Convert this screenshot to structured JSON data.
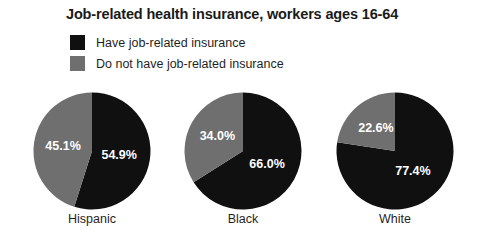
{
  "chart_data": {
    "type": "pie",
    "title": "Job-related health insurance, workers ages 16-64",
    "xlabel": "",
    "ylabel": "",
    "legend_position": "top-left",
    "grid": false,
    "categories": [
      "Hispanic",
      "Black",
      "White"
    ],
    "series": [
      {
        "name": "Have job-related insurance",
        "color": "#101010",
        "values": [
          54.9,
          66.0,
          77.4
        ]
      },
      {
        "name": "Do not have job-related insurance",
        "color": "#6f6f6f",
        "values": [
          45.1,
          34.0,
          22.6
        ]
      }
    ],
    "pies": [
      {
        "group": "Hispanic",
        "caption": "Hispanic",
        "slices": [
          {
            "label": "54.9%",
            "value": 54.9,
            "series": "Have job-related insurance",
            "color": "#101010"
          },
          {
            "label": "45.1%",
            "value": 45.1,
            "series": "Do not have job-related insurance",
            "color": "#6f6f6f"
          }
        ]
      },
      {
        "group": "Black",
        "caption": "Black",
        "slices": [
          {
            "label": "66.0%",
            "value": 66.0,
            "series": "Have job-related insurance",
            "color": "#101010"
          },
          {
            "label": "34.0%",
            "value": 34.0,
            "series": "Do not have job-related insurance",
            "color": "#6f6f6f"
          }
        ]
      },
      {
        "group": "White",
        "caption": "White",
        "slices": [
          {
            "label": "77.4%",
            "value": 77.4,
            "series": "Have job-related insurance",
            "color": "#101010"
          },
          {
            "label": "22.6%",
            "value": 22.6,
            "series": "Do not have job-related insurance",
            "color": "#6f6f6f"
          }
        ]
      }
    ],
    "units": "percent",
    "total": 100
  },
  "legend": {
    "items": [
      {
        "label": "Have job-related insurance",
        "color": "#101010"
      },
      {
        "label": "Do not have job-related insurance",
        "color": "#6f6f6f"
      }
    ]
  }
}
